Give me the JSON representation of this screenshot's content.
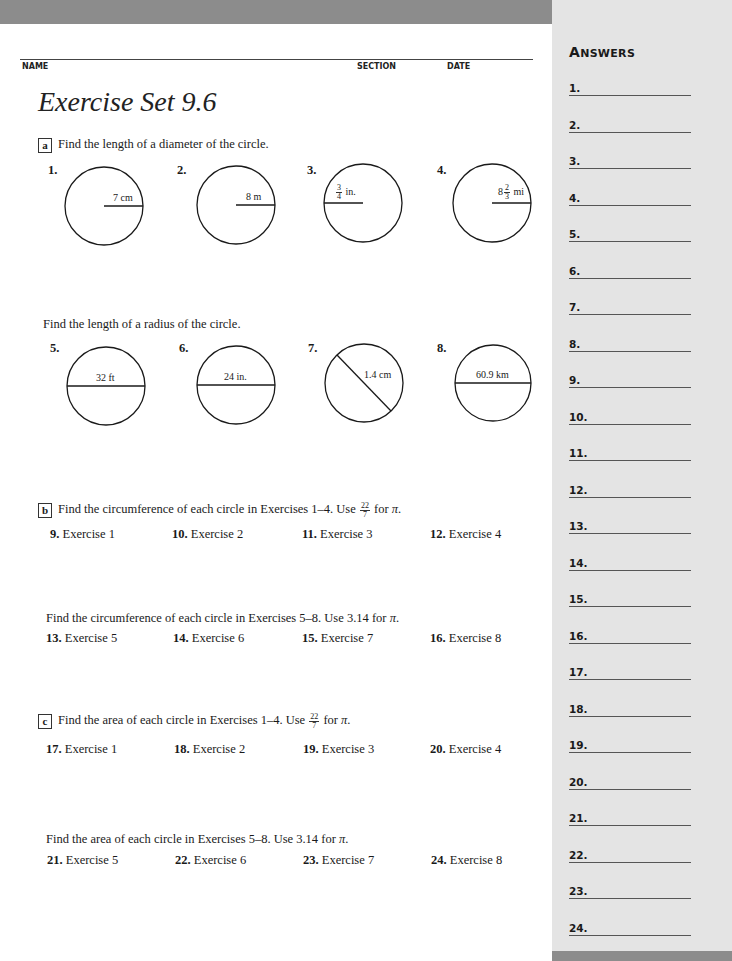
{
  "header": {
    "name_label": "NAME",
    "section_label": "SECTION",
    "date_label": "DATE"
  },
  "title": "Exercise Set 9.6",
  "sections": {
    "a": {
      "letter": "a",
      "diameter_instruction": "Find the length of a diameter of the circle.",
      "radius_instruction": "Find the length of a radius of the circle.",
      "circles": [
        {
          "num": "1.",
          "label": "7 cm",
          "type": "radius"
        },
        {
          "num": "2.",
          "label": "8 m",
          "type": "radius"
        },
        {
          "num": "3.",
          "label_frac_num": "3",
          "label_frac_den": "4",
          "label_unit": "in.",
          "type": "radius"
        },
        {
          "num": "4.",
          "label_whole": "8",
          "label_frac_num": "2",
          "label_frac_den": "3",
          "label_unit": "mi",
          "type": "radius"
        },
        {
          "num": "5.",
          "label": "32 ft",
          "type": "diameter"
        },
        {
          "num": "6.",
          "label": "24 in.",
          "type": "diameter"
        },
        {
          "num": "7.",
          "label": "1.4 cm",
          "type": "diameter"
        },
        {
          "num": "8.",
          "label": "60.9 km",
          "type": "diameter"
        }
      ]
    },
    "b": {
      "letter": "b",
      "instruction1_pre": "Find the circumference of each circle in Exercises 1–4. Use",
      "instruction1_frac_num": "22",
      "instruction1_frac_den": "7",
      "instruction1_post": "for",
      "pi": "π",
      "period": ".",
      "instruction2_pre": "Find the circumference of each circle in Exercises 5–8. Use 3.14 for",
      "items1": [
        {
          "num": "9.",
          "text": "Exercise 1"
        },
        {
          "num": "10.",
          "text": "Exercise 2"
        },
        {
          "num": "11.",
          "text": "Exercise 3"
        },
        {
          "num": "12.",
          "text": "Exercise 4"
        }
      ],
      "items2": [
        {
          "num": "13.",
          "text": "Exercise 5"
        },
        {
          "num": "14.",
          "text": "Exercise 6"
        },
        {
          "num": "15.",
          "text": "Exercise 7"
        },
        {
          "num": "16.",
          "text": "Exercise 8"
        }
      ]
    },
    "c": {
      "letter": "c",
      "instruction1_pre": "Find the area of each circle in Exercises 1–4. Use",
      "instruction1_frac_num": "22",
      "instruction1_frac_den": "7",
      "instruction1_post": "for",
      "pi": "π",
      "period": ".",
      "instruction2_pre": "Find the area of each circle in Exercises 5–8. Use 3.14 for",
      "items1": [
        {
          "num": "17.",
          "text": "Exercise 1"
        },
        {
          "num": "18.",
          "text": "Exercise 2"
        },
        {
          "num": "19.",
          "text": "Exercise 3"
        },
        {
          "num": "20.",
          "text": "Exercise 4"
        }
      ],
      "items2": [
        {
          "num": "21.",
          "text": "Exercise 5"
        },
        {
          "num": "22.",
          "text": "Exercise 6"
        },
        {
          "num": "23.",
          "text": "Exercise 7"
        },
        {
          "num": "24.",
          "text": "Exercise 8"
        }
      ]
    }
  },
  "answers": {
    "title_first": "A",
    "title_rest": "NSWERS",
    "lines": [
      "1.",
      "2.",
      "3.",
      "4.",
      "5.",
      "6.",
      "7.",
      "8.",
      "9.",
      "10.",
      "11.",
      "12.",
      "13.",
      "14.",
      "15.",
      "16.",
      "17.",
      "18.",
      "19.",
      "20.",
      "21.",
      "22.",
      "23.",
      "24."
    ]
  },
  "colors": {
    "bar_gray": "#8c8c8c",
    "sidebar_gray": "#e4e4e4"
  }
}
